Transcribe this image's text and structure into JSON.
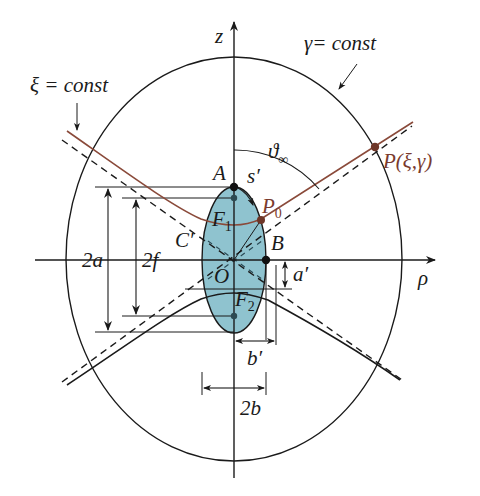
{
  "diagram": {
    "type": "geometry",
    "colors": {
      "line": "#1a1a1a",
      "hyperbola_highlight": "#8a4a3a",
      "point_highlight": "#6e3628",
      "spheroid_fill": "#8fc3cf",
      "background": "#ffffff"
    },
    "axes": {
      "z_label": "z",
      "rho_label": "ρ"
    },
    "curve_labels": {
      "xi_const": "ξ = const",
      "gamma_const": "γ= const"
    },
    "angle_label": {
      "symbol": "ϑ",
      "subscript": "∞"
    },
    "points": {
      "A": "A",
      "B": "B",
      "O": "O",
      "C_prime": "C′",
      "F1": {
        "base": "F",
        "sub": "1"
      },
      "F2": {
        "base": "F",
        "sub": "2"
      },
      "P0": {
        "base": "P",
        "sub": "0"
      },
      "P": "P(ξ,γ)",
      "s_prime": "s′"
    },
    "dimensions": {
      "two_a": "2a",
      "two_f": "2f",
      "two_b": "2b",
      "a_prime": "a′",
      "b_prime": "b′"
    }
  }
}
